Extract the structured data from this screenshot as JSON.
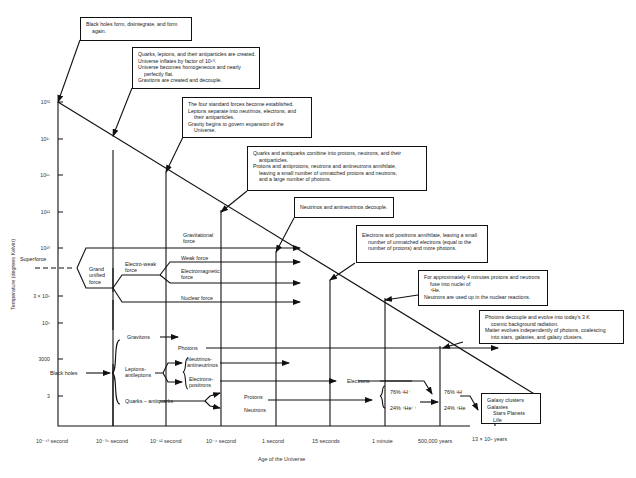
{
  "diagram": {
    "y_axis": {
      "label": "Temperature (degrees Kelvin)",
      "ticks": [
        "10³²",
        "10²⁷",
        "10¹⁵",
        "10¹²",
        "10¹⁰",
        "3 × 10⁹",
        "10⁶",
        "3000",
        "3"
      ]
    },
    "x_axis": {
      "label": "Age of the Universe",
      "ticks": [
        "10⁻⁴³ second",
        "10⁻³⁵ second",
        "10⁻¹² second",
        "10⁻⁶ second",
        "1 second",
        "15 seconds",
        "1 minute",
        "500,000 years",
        "13 × 10⁹ years"
      ]
    },
    "notes": [
      {
        "lines": [
          "Black holes form, disintegrate, and form",
          "again."
        ]
      },
      {
        "lines": [
          "Quarks, leptons, and their antiparticles are created.",
          "Universe inflates by factor of 10⁵⁰.",
          "Universe becomes homogeneous and nearly",
          "perfectly flat.",
          "Gravitons are created and decouple."
        ]
      },
      {
        "lines": [
          "The four standard forces become established.",
          "Leptons separate into neutrinos, electrons, and",
          "their antiparticles.",
          "Gravity begins to govern expansion of the",
          "Universe."
        ]
      },
      {
        "lines": [
          "Quarks and antiquarks combine into protons, neutrons, and their",
          "antiparticles.",
          "Protons and antiprotons, neutrons and antineutrons annihilate,",
          "leaving a small number of unmatched protons and neutrons,",
          "and a large number of photons."
        ]
      },
      {
        "lines": [
          "Neutrinos and antineutrinos decouple."
        ]
      },
      {
        "lines": [
          "Electrons and positrons annihilate, leaving a small",
          "number of unmatched electrons (equal to the",
          "number of protons) and more photons."
        ]
      },
      {
        "lines": [
          "For approximately 4 minutes protons and neutrons",
          "fuse into nuclei of",
          "⁴He.",
          "Neutrons are used up in the nuclear reactions."
        ]
      },
      {
        "lines": [
          "Photons decouple and evolve into today's 3 K",
          "cosmic background radiation.",
          "Matter evolves independently of photons, coalescing",
          "into stars, galaxies, and galaxy clusters."
        ]
      },
      {
        "lines": [
          "Galaxy clusters",
          "Galaxies",
          "Stars   Planets",
          "Life"
        ]
      }
    ],
    "forces": {
      "superforce": "Superforce",
      "grand_unified": [
        "Grand",
        "unified",
        "force"
      ],
      "electroweak": [
        "Electro-weak",
        "force"
      ],
      "gravitational": [
        "Gravitational",
        "force"
      ],
      "weak": "Weak force",
      "electromagnetic": [
        "Electromagnetic",
        "force"
      ],
      "nuclear": "Nuclear force"
    },
    "particles": {
      "black_holes": "Black holes",
      "gravitons": "Gravitons",
      "leptons": [
        "Leptons-",
        "antileptons"
      ],
      "quarks": "Quarks – antiquarks",
      "photons": "Photons",
      "neutrinos": [
        "Neutrinos-",
        "antineutrinos"
      ],
      "electrons_positrons": [
        "Electrons-",
        "positrons"
      ],
      "protons": "Protons",
      "neutrons": "Neutrons",
      "electrons": "Electrons",
      "h_ion": "76% ¹H⁺",
      "he_ion": "24% ⁴He⁺⁺",
      "h_atom": "76% ¹H",
      "he_atom": "24% ⁴He"
    }
  }
}
